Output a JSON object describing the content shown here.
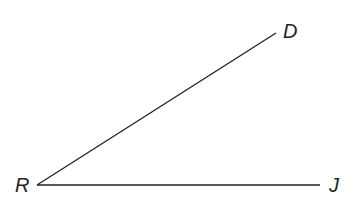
{
  "diagram": {
    "type": "angle",
    "vertex": {
      "label": "R",
      "x": 37,
      "y": 185
    },
    "rays": [
      {
        "name": "ray-RD",
        "end": {
          "label": "D",
          "x": 276,
          "y": 33
        }
      },
      {
        "name": "ray-RJ",
        "end": {
          "label": "J",
          "x": 320,
          "y": 185
        }
      }
    ],
    "labels": {
      "R": "R",
      "D": "D",
      "J": "J"
    },
    "stroke_color": "#231f20"
  }
}
